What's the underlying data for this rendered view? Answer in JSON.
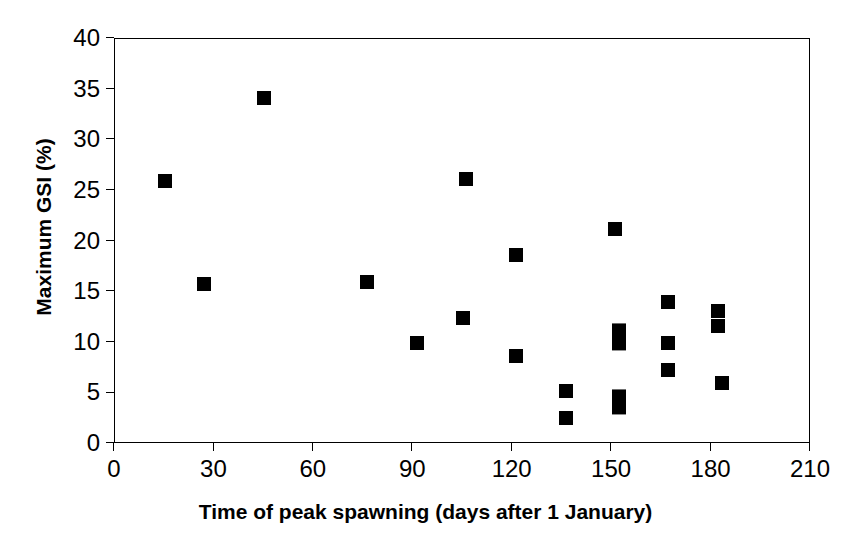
{
  "chart_data": {
    "type": "scatter",
    "title": "",
    "subtitle": "",
    "xlabel": "Time of peak spawning (days after 1 January)",
    "ylabel": "Maximum GSI (%)",
    "xlim": [
      0,
      210
    ],
    "ylim": [
      0,
      40
    ],
    "xticks": [
      0,
      30,
      60,
      90,
      120,
      150,
      180,
      210
    ],
    "yticks": [
      0,
      5,
      10,
      15,
      20,
      25,
      30,
      35,
      40
    ],
    "xtick_labels": [
      "0",
      "30",
      "60",
      "90",
      "120",
      "150",
      "180",
      "210"
    ],
    "ytick_labels": [
      "0",
      "5",
      "10",
      "15",
      "20",
      "25",
      "30",
      "35",
      "40"
    ],
    "grid": false,
    "legend": null,
    "marker": {
      "shape": "square",
      "color": "#000000",
      "size": 14
    },
    "series": [
      {
        "name": "Maximum GSI vs time of peak spawning",
        "color": "#000000",
        "points": [
          {
            "x": 15,
            "y": 26.0
          },
          {
            "x": 27,
            "y": 15.8
          },
          {
            "x": 45,
            "y": 34.2
          },
          {
            "x": 76,
            "y": 16.0
          },
          {
            "x": 91,
            "y": 10.0
          },
          {
            "x": 105,
            "y": 12.4
          },
          {
            "x": 106,
            "y": 26.2
          },
          {
            "x": 121,
            "y": 18.7
          },
          {
            "x": 121,
            "y": 8.7
          },
          {
            "x": 136,
            "y": 5.2
          },
          {
            "x": 136,
            "y": 2.6
          },
          {
            "x": 151,
            "y": 21.2
          },
          {
            "x": 152,
            "y": 11.2
          },
          {
            "x": 152,
            "y": 9.9
          },
          {
            "x": 152,
            "y": 4.7
          },
          {
            "x": 152,
            "y": 3.6
          },
          {
            "x": 167,
            "y": 14.0
          },
          {
            "x": 167,
            "y": 10.0
          },
          {
            "x": 167,
            "y": 7.3
          },
          {
            "x": 182,
            "y": 13.1
          },
          {
            "x": 182,
            "y": 11.7
          },
          {
            "x": 183,
            "y": 6.0
          }
        ]
      }
    ]
  },
  "axes": {
    "x_title": "Time of peak spawning (days after 1 January)",
    "y_title": "Maximum GSI (%)"
  }
}
